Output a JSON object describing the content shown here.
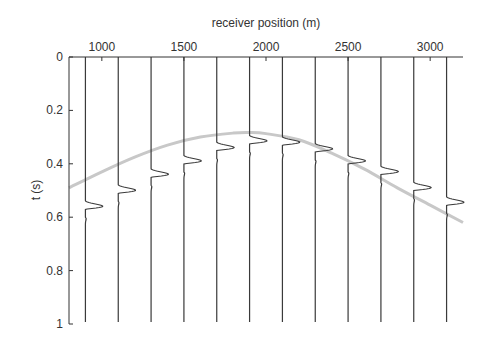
{
  "chart_data": {
    "type": "line",
    "title": "",
    "xlabel": "receiver position (m)",
    "ylabel": "t (s)",
    "xlim": [
      800,
      3200
    ],
    "ylim": [
      0,
      1
    ],
    "y_inverted": true,
    "x_axis_position": "top",
    "x_ticks": [
      1000,
      1500,
      2000,
      2500,
      3000
    ],
    "x_tick_labels": [
      "1000",
      "1500",
      "2000",
      "2500",
      "3000"
    ],
    "y_ticks": [
      0,
      0.2,
      0.4,
      0.6,
      0.8,
      1
    ],
    "y_tick_labels": [
      "0",
      "0.2",
      "0.4",
      "0.6",
      "0.8",
      "1"
    ],
    "grid": false,
    "series": [
      {
        "name": "seismic traces (wavelet arrival time)",
        "style": "wiggle",
        "color": "#3a3a3a",
        "x": [
          900,
          1100,
          1300,
          1500,
          1700,
          1900,
          2100,
          2300,
          2500,
          2700,
          2900,
          3100
        ],
        "values": [
          0.57,
          0.51,
          0.45,
          0.4,
          0.35,
          0.325,
          0.33,
          0.355,
          0.4,
          0.44,
          0.5,
          0.555
        ]
      },
      {
        "name": "traveltime curve",
        "style": "line",
        "color": "#c8c8c8",
        "x": [
          800,
          1000,
          1200,
          1400,
          1600,
          1800,
          1900,
          2000,
          2200,
          2400,
          2600,
          2800,
          3000,
          3200
        ],
        "values": [
          0.49,
          0.43,
          0.375,
          0.33,
          0.3,
          0.285,
          0.283,
          0.287,
          0.31,
          0.36,
          0.42,
          0.49,
          0.555,
          0.62
        ]
      }
    ]
  },
  "labels": {
    "xlabel": "receiver position (m)",
    "ylabel": "t (s)"
  }
}
